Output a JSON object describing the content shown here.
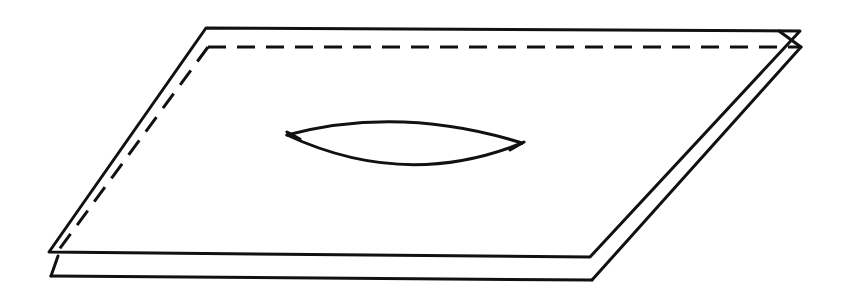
{
  "figure": {
    "title": "Two parallel planes with lens-shaped opening",
    "stroke_color": "#111111",
    "background": "#ffffff",
    "planes": [
      {
        "name": "upper-plane",
        "style": "solid",
        "points": [
          [
            206,
            28
          ],
          [
            800,
            31
          ],
          [
            590,
            257
          ],
          [
            49,
            252
          ]
        ]
      },
      {
        "name": "lower-plane",
        "style": "partially-dashed",
        "hidden_edges": [
          [
            [
              208,
              47
            ],
            [
              801,
              47
            ]
          ],
          [
            [
              208,
              47
            ],
            [
              58,
              251
            ]
          ]
        ],
        "visible_edges": [
          [
            [
              801,
              47
            ],
            [
              592,
              280
            ]
          ],
          [
            [
              592,
              280
            ],
            [
              51,
              276
            ]
          ],
          [
            [
              51,
              276
            ],
            [
              58,
              256
            ]
          ],
          [
            [
              779,
              31
            ],
            [
              801,
              47
            ]
          ]
        ]
      }
    ],
    "lens": {
      "left_tip": [
        287,
        135
      ],
      "right_tip": [
        522,
        143
      ],
      "top_control": [
        400,
        105
      ],
      "bottom_control": [
        405,
        190
      ],
      "tick_left": [
        [
          287,
          132
        ],
        [
          300,
          139
        ]
      ],
      "tick_right": [
        [
          510,
          150
        ],
        [
          524,
          142
        ]
      ]
    }
  }
}
